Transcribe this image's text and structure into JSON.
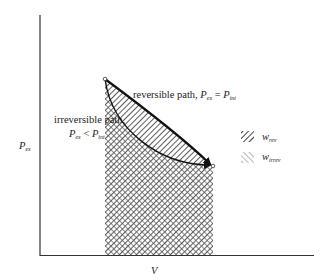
{
  "figure": {
    "type": "pressure-volume work diagram",
    "axes": {
      "ylabel": "P",
      "ylabel_sub": "ex",
      "xlabel": "V"
    },
    "annotations": {
      "reversible": {
        "text": "reversible path, ",
        "lhs": "P",
        "lhs_sub": "ex",
        "op": " = ",
        "rhs": "P",
        "rhs_sub": "int"
      },
      "irreversible": {
        "line1": "irreversible path,",
        "lhs": "P",
        "lhs_sub": "ex",
        "op": " < ",
        "rhs": "P",
        "rhs_sub": "int"
      }
    },
    "legend": [
      {
        "symbol": "w",
        "sub": "rev",
        "pattern": "dense-forward-diagonal-hatch"
      },
      {
        "symbol": "w",
        "sub": "irrev",
        "pattern": "light-back-diagonal-hatch"
      }
    ],
    "colors": {
      "ink": "#222222",
      "hatch_rev": "#333333",
      "hatch_irrev": "#666666",
      "background": "#ffffff"
    }
  }
}
